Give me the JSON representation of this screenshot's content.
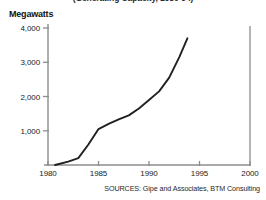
{
  "chart_data": {
    "type": "line",
    "title": "(Generating Capacity, 1980-94)",
    "xlabel": "",
    "ylabel": "Megawatts",
    "xlim": [
      1980,
      2000
    ],
    "ylim": [
      0,
      4000
    ],
    "grid": false,
    "legend": "none",
    "x_ticks": [
      "1980",
      "1985",
      "1990",
      "1995",
      "2000"
    ],
    "x_tick_values": [
      1980,
      1985,
      1990,
      1995,
      2000
    ],
    "y_ticks": [
      "1,000",
      "2,000",
      "3,000",
      "4,000"
    ],
    "y_tick_values": [
      1000,
      2000,
      3000,
      4000
    ],
    "series": [
      {
        "name": "Wind generating capacity",
        "x": [
          1980.7,
          1982,
          1983,
          1984,
          1985,
          1986,
          1987,
          1988,
          1989,
          1990,
          1991,
          1992,
          1993,
          1993.8
        ],
        "values": [
          0,
          100,
          200,
          600,
          1050,
          1200,
          1330,
          1450,
          1650,
          1900,
          2150,
          2550,
          3150,
          3700
        ]
      }
    ],
    "annotations": []
  },
  "source": {
    "text": "SOURCES: Gipe and Associates, BTM Consulting"
  },
  "colors": {
    "line": "#231f20",
    "axis": "#8d8d8d",
    "background": "#ffffff",
    "text": "#1a1a1a"
  }
}
